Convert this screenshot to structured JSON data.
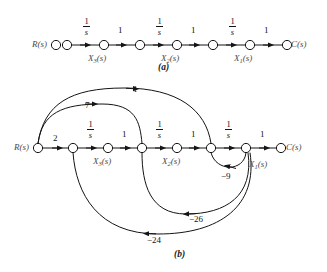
{
  "figure": {
    "type": "signal-flow-graph",
    "panels": [
      {
        "id": "a",
        "caption": "(a)",
        "description": "Cascade signal-flow graph of three integrators",
        "nodes": [
          {
            "id": "Rs_iso",
            "label": "R(s)",
            "label_side": "left",
            "x": 56,
            "y": 45
          },
          {
            "id": "n1",
            "label": "",
            "x": 67,
            "y": 45
          },
          {
            "id": "n2",
            "label": "X3(s)",
            "label_side": "below",
            "x": 104,
            "y": 45
          },
          {
            "id": "n3",
            "label": "",
            "x": 140,
            "y": 45
          },
          {
            "id": "n4",
            "label": "X2(s)",
            "label_side": "below",
            "x": 177,
            "y": 45
          },
          {
            "id": "n5",
            "label": "",
            "x": 213,
            "y": 45
          },
          {
            "id": "n6",
            "label": "X1(s)",
            "label_side": "below",
            "x": 250,
            "y": 45
          },
          {
            "id": "n7",
            "label": "C(s)",
            "label_side": "right",
            "x": 287,
            "y": 45
          }
        ],
        "edges": [
          {
            "from": "n1",
            "to": "n2",
            "gain": "1/s",
            "kind": "fraction"
          },
          {
            "from": "n2",
            "to": "n3",
            "gain": "1",
            "kind": "plain"
          },
          {
            "from": "n3",
            "to": "n4",
            "gain": "1/s",
            "kind": "fraction"
          },
          {
            "from": "n4",
            "to": "n5",
            "gain": "1",
            "kind": "plain"
          },
          {
            "from": "n5",
            "to": "n6",
            "gain": "1/s",
            "kind": "fraction"
          },
          {
            "from": "n6",
            "to": "n7",
            "gain": "1",
            "kind": "plain"
          }
        ]
      },
      {
        "id": "b",
        "caption": "(b)",
        "description": "Signal-flow graph with feedback and feedforward paths",
        "nodes": [
          {
            "id": "b_R",
            "label": "R(s)",
            "label_side": "left",
            "x": 38,
            "y": 148
          },
          {
            "id": "b_n2",
            "label": "",
            "x": 73,
            "y": 148
          },
          {
            "id": "b_n3",
            "label": "X3(s)",
            "label_side": "below",
            "x": 108,
            "y": 148
          },
          {
            "id": "b_n4",
            "label": "",
            "x": 142,
            "y": 148
          },
          {
            "id": "b_n5",
            "label": "X2(s)",
            "label_side": "below",
            "x": 177,
            "y": 148
          },
          {
            "id": "b_n6",
            "label": "",
            "x": 211,
            "y": 148
          },
          {
            "id": "b_n7",
            "label": "X1(s)",
            "label_side": "below-right",
            "x": 246,
            "y": 148
          },
          {
            "id": "b_C",
            "label": "C(s)",
            "label_side": "right",
            "x": 281,
            "y": 148
          }
        ],
        "edges": [
          {
            "from": "b_R",
            "to": "b_n2",
            "gain": "2",
            "kind": "plain"
          },
          {
            "from": "b_n2",
            "to": "b_n3",
            "gain": "1/s",
            "kind": "fraction"
          },
          {
            "from": "b_n3",
            "to": "b_n4",
            "gain": "1",
            "kind": "plain"
          },
          {
            "from": "b_n4",
            "to": "b_n5",
            "gain": "1/s",
            "kind": "fraction"
          },
          {
            "from": "b_n5",
            "to": "b_n6",
            "gain": "1",
            "kind": "plain"
          },
          {
            "from": "b_n6",
            "to": "b_n7",
            "gain": "1/s",
            "kind": "fraction"
          },
          {
            "from": "b_n7",
            "to": "b_C",
            "gain": "1",
            "kind": "plain"
          },
          {
            "from": "b_R",
            "to": "b_n6",
            "gain": "1",
            "kind": "arc-above"
          },
          {
            "from": "b_R",
            "to": "b_n4",
            "gain": "7",
            "kind": "arc-above"
          },
          {
            "from": "b_n7",
            "to": "b_n6",
            "gain": "-9",
            "kind": "arc-below"
          },
          {
            "from": "b_n7",
            "to": "b_n4",
            "gain": "-26",
            "kind": "arc-below"
          },
          {
            "from": "b_n7",
            "to": "b_n2",
            "gain": "-24",
            "kind": "arc-below"
          }
        ]
      }
    ]
  },
  "labels": {
    "R_of_s": "R(s)",
    "C_of_s": "C(s)",
    "X1_of_s": "X1(s)",
    "X2_of_s": "X2(s)",
    "X3_of_s": "X3(s)",
    "gain_one": "1",
    "gain_two": "2",
    "gain_seven": "7",
    "gain_minus_nine": "−9",
    "gain_minus_twentysix": "−26",
    "gain_minus_twentyfour": "−24",
    "frac_num": "1",
    "frac_den": "s",
    "caption_a": "(a)",
    "caption_b": "(b)"
  },
  "colors": {
    "stroke": "#141414",
    "node_fill": "#ffffff",
    "label_text": "#4a4a4a",
    "background": "#ffffff"
  }
}
